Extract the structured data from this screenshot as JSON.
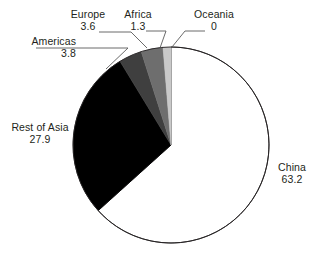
{
  "chart_data": {
    "type": "pie",
    "title": "",
    "categories": [
      "China",
      "Rest of Asia",
      "Americas",
      "Europe",
      "Africa",
      "Oceania"
    ],
    "values": [
      63.2,
      27.9,
      3.8,
      3.6,
      1.3,
      0
    ],
    "value_labels": [
      "63.2",
      "27.9",
      "3.8",
      "3.6",
      "1.3",
      "0"
    ],
    "colors": [
      "#ffffff",
      "#000000",
      "#3f3f3f",
      "#6e6e6e",
      "#c9c9c9",
      "#e8e8e8"
    ],
    "start_angle_deg": 0,
    "direction": "clockwise",
    "legend": "none",
    "grid": false,
    "labels_position": "outside-with-leader-lines",
    "outline_color": "#231f20",
    "slices": [
      {
        "name": "China",
        "value": "63.2",
        "color": "#ffffff"
      },
      {
        "name": "Rest of Asia",
        "value": "27.9",
        "color": "#000000"
      },
      {
        "name": "Americas",
        "value": "3.8",
        "color": "#3f3f3f"
      },
      {
        "name": "Europe",
        "value": "3.6",
        "color": "#6e6e6e"
      },
      {
        "name": "Africa",
        "value": "1.3",
        "color": "#c9c9c9"
      },
      {
        "name": "Oceania",
        "value": "0",
        "color": "#e8e8e8"
      }
    ]
  },
  "labels": {
    "china": {
      "name": "China",
      "value": "63.2"
    },
    "rest_of_asia": {
      "name": "Rest of Asia",
      "value": "27.9"
    },
    "americas": {
      "name": "Americas",
      "value": "3.8"
    },
    "europe": {
      "name": "Europe",
      "value": "3.6"
    },
    "africa": {
      "name": "Africa",
      "value": "1.3"
    },
    "oceania": {
      "name": "Oceania",
      "value": "0"
    }
  }
}
